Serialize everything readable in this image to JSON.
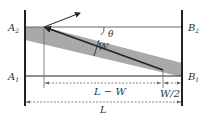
{
  "diagram": {
    "labels": {
      "A2": "A",
      "A2_sub": "2",
      "B2": "B",
      "B2_sub": "2",
      "A1": "A",
      "A1_sub": "1",
      "B1": "B",
      "B1_sub": "1",
      "theta": "θ",
      "W": "W",
      "L_minus_W": "L − W",
      "W_half": "W/2",
      "L": "L"
    },
    "colors": {
      "line": "#222222",
      "band": "#a9a9a9",
      "dashed": "#666666",
      "text": "#333333"
    }
  }
}
